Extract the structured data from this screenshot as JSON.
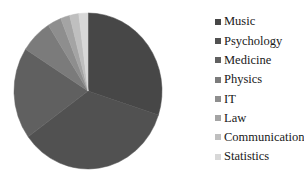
{
  "chart_data": {
    "type": "pie",
    "title": "",
    "legend_position": "right",
    "start_angle": "12-o-clock, clockwise",
    "background_color": "#ffffff",
    "legend_text_color": "#191919",
    "slices": [
      {
        "label": "Music",
        "value": 30,
        "color": "#474747"
      },
      {
        "label": "Psychology",
        "value": 35,
        "color": "#515151"
      },
      {
        "label": "Medicine",
        "value": 19,
        "color": "#606060"
      },
      {
        "label": "Physics",
        "value": 7,
        "color": "#7b7b7b"
      },
      {
        "label": "IT",
        "value": 3,
        "color": "#8e8e8e"
      },
      {
        "label": "Law",
        "value": 2,
        "color": "#a4a4a4"
      },
      {
        "label": "Communication",
        "value": 2,
        "color": "#bfbfbf"
      },
      {
        "label": "Statistics",
        "value": 2,
        "color": "#d8d8d8"
      }
    ]
  }
}
